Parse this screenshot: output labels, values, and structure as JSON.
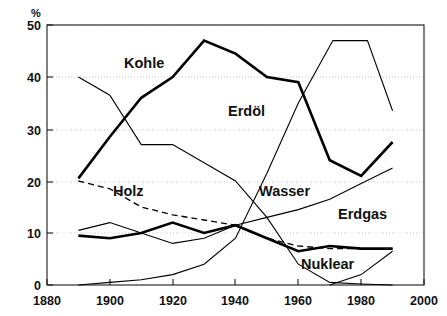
{
  "chart_data": {
    "type": "line",
    "title": "",
    "subtitle": "",
    "xlabel": "",
    "ylabel": "%",
    "y_unit_label": "%",
    "xlim": [
      1880,
      2000
    ],
    "ylim": [
      0,
      50
    ],
    "x_ticks": [
      1880,
      1900,
      1920,
      1940,
      1960,
      1980,
      2000
    ],
    "x_tick_labels": [
      "1880",
      "1900",
      "1920",
      "1940",
      "1960",
      "1980",
      "2000"
    ],
    "y_ticks": [
      0,
      10,
      20,
      30,
      40,
      50
    ],
    "y_tick_labels": [
      "0",
      "10",
      "20",
      "30",
      "40",
      "50"
    ],
    "grid": "horizontal-dotted",
    "legend_position": "inline-annotations",
    "annotations": [
      {
        "text": "Kohle",
        "x": 1920,
        "y": 42.5
      },
      {
        "text": "Erdöl",
        "x": 1945,
        "y": 33.0
      },
      {
        "text": "Holz",
        "x": 1908,
        "y": 18.5
      },
      {
        "text": "Wasser",
        "x": 1950,
        "y": 19.5
      },
      {
        "text": "Erdgas",
        "x": 1972,
        "y": 14.5
      },
      {
        "text": "Nuklear",
        "x": 1972,
        "y": 5.0
      }
    ],
    "series": [
      {
        "name": "Kohle",
        "style": "thick-solid",
        "x": [
          1890,
          1900,
          1910,
          1920,
          1930,
          1940,
          1950,
          1960,
          1970,
          1980,
          1990
        ],
        "values": [
          20.5,
          28.5,
          36.0,
          40.0,
          47.0,
          44.5,
          40.0,
          39.0,
          24.0,
          21.0,
          27.5
        ]
      },
      {
        "name": "Erdöl",
        "style": "thin-solid",
        "x": [
          1890,
          1900,
          1910,
          1920,
          1930,
          1940,
          1950,
          1960,
          1970,
          1980,
          1990
        ],
        "values": [
          40.0,
          36.5,
          27.0,
          27.0,
          23.5,
          20.0,
          13.0,
          4.0,
          0.5,
          0.2,
          0.0
        ]
      },
      {
        "name": "Holz",
        "style": "dashed",
        "x": [
          1890,
          1900,
          1910,
          1920,
          1930,
          1940,
          1950,
          1960,
          1970,
          1980,
          1990
        ],
        "values": [
          20.0,
          18.5,
          15.0,
          13.5,
          12.5,
          11.5,
          9.0,
          7.5,
          7.0,
          7.0,
          7.0
        ]
      },
      {
        "name": "Wasser",
        "style": "thick-solid",
        "x": [
          1890,
          1900,
          1910,
          1920,
          1930,
          1940,
          1950,
          1960,
          1970,
          1980,
          1990
        ],
        "values": [
          9.5,
          9.0,
          10.0,
          12.0,
          10.0,
          11.5,
          9.0,
          6.5,
          7.5,
          7.0,
          7.0
        ]
      },
      {
        "name": "Erdgas",
        "style": "thin-solid",
        "x": [
          1890,
          1900,
          1910,
          1920,
          1930,
          1940,
          1950,
          1960,
          1970,
          1980,
          1990
        ],
        "values": [
          10.5,
          12.0,
          10.0,
          8.0,
          9.0,
          11.5,
          13.0,
          14.5,
          16.5,
          19.5,
          22.5
        ]
      },
      {
        "name": "Nuklear",
        "style": "thin-solid",
        "x": [
          1970,
          1980,
          1990
        ],
        "values": [
          0.0,
          2.0,
          6.5
        ]
      }
    ],
    "note_curves": {
      "erdoel_rise": {
        "name": "Erdöl",
        "x": [
          1890,
          1900,
          1910,
          1920,
          1930,
          1940,
          1950,
          1960,
          1971,
          1982,
          1990
        ],
        "values": [
          0.0,
          0.5,
          1.0,
          2.0,
          4.0,
          9.0,
          21.5,
          35.0,
          47.0,
          47.0,
          33.5
        ]
      }
    }
  },
  "series_labels": {
    "kohle": "Kohle",
    "erdoel": "Erdöl",
    "holz": "Holz",
    "wasser": "Wasser",
    "erdgas": "Erdgas",
    "nuklear": "Nuklear"
  },
  "axes": {
    "y_unit": "%",
    "x": [
      "1880",
      "1900",
      "1920",
      "1940",
      "1960",
      "1980",
      "2000"
    ],
    "y": [
      "0",
      "10",
      "20",
      "30",
      "40",
      "50"
    ]
  },
  "colors": {
    "line": "#000000",
    "frame": "#1a1a1a",
    "grid": "#b9b9b9",
    "background": "#ffffff"
  }
}
